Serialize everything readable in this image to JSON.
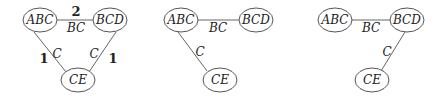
{
  "diagrams": [
    {
      "nodes": {
        "abc": "ABC",
        "bcd": "BCD",
        "ce": "CE"
      },
      "edges": {
        "abc_bcd": {
          "label": "BC",
          "weight": "2"
        },
        "abc_ce": {
          "label": "C",
          "weight": "1"
        },
        "bcd_ce": {
          "label": "C",
          "weight": "1"
        }
      }
    },
    {
      "nodes": {
        "abc": "ABC",
        "bcd": "BCD",
        "ce": "CE"
      },
      "edges": {
        "abc_bcd": {
          "label": "BC"
        },
        "abc_ce": {
          "label": "C"
        }
      }
    },
    {
      "nodes": {
        "abc": "ABC",
        "bcd": "BCD",
        "ce": "CE"
      },
      "edges": {
        "abc_bcd": {
          "label": "BC"
        },
        "bcd_ce": {
          "label": "C"
        }
      }
    }
  ]
}
